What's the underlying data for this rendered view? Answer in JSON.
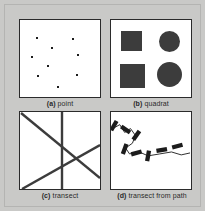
{
  "figure": {
    "background_color": "#c9c9c7",
    "panel_background_color": "#ffffff",
    "panel_border_color": "#2b2b2b",
    "ink_color": "#3c3c3c",
    "panels": [
      {
        "id": "a",
        "key": "(a)",
        "label": "point",
        "caption": "(a) point",
        "type": "point-sampling",
        "points": [
          {
            "x": 16,
            "y": 17
          },
          {
            "x": 52,
            "y": 18
          },
          {
            "x": 31,
            "y": 27
          },
          {
            "x": 11,
            "y": 36
          },
          {
            "x": 57,
            "y": 34
          },
          {
            "x": 27,
            "y": 45
          },
          {
            "x": 17,
            "y": 55
          },
          {
            "x": 56,
            "y": 54
          },
          {
            "x": 37,
            "y": 66
          }
        ]
      },
      {
        "id": "b",
        "key": "(b)",
        "label": "quadrat",
        "caption": "(b) quadrat",
        "type": "quadrat-sampling",
        "shapes": [
          {
            "kind": "square",
            "x": 10,
            "y": 11,
            "w": 21,
            "h": 20
          },
          {
            "kind": "circle",
            "x": 48,
            "y": 11,
            "w": 21,
            "h": 21
          },
          {
            "kind": "square",
            "x": 9,
            "y": 44,
            "w": 25,
            "h": 24
          },
          {
            "kind": "circle",
            "x": 46,
            "y": 42,
            "w": 25,
            "h": 25
          }
        ]
      },
      {
        "id": "c",
        "key": "(c)",
        "label": "transect",
        "caption": "(c) transect",
        "type": "transect-sampling",
        "lines": [
          {
            "name": "vertical-transect",
            "x1": 42,
            "y1": 0,
            "x2": 42,
            "y2": 78
          },
          {
            "name": "descending-diagonal",
            "x1": 1,
            "y1": 1,
            "x2": 80,
            "y2": 66
          },
          {
            "name": "ascending-diagonal",
            "x1": 2,
            "y1": 77,
            "x2": 80,
            "y2": 33
          }
        ]
      },
      {
        "id": "d",
        "key": "(d)",
        "label": "transect from path",
        "caption": "(d) transect from path",
        "type": "path-transect-sampling",
        "path": "M 0 17 L 9 12 L 14 20 L 20 16 L 25 23 L 22 31 L 15 36 L 19 42 L 29 40 L 38 44 L 50 42 L 62 40 L 72 43 L 81 41",
        "markers": [
          {
            "x": 3,
            "y": 13,
            "angle": 30
          },
          {
            "x": 15,
            "y": 17,
            "angle": -55
          },
          {
            "x": 26,
            "y": 23,
            "angle": 35
          },
          {
            "x": 14,
            "y": 37,
            "angle": 20
          },
          {
            "x": 26,
            "y": 41,
            "angle": 75
          },
          {
            "x": 38,
            "y": 44,
            "angle": 10
          },
          {
            "x": 52,
            "y": 38,
            "angle": 80
          },
          {
            "x": 68,
            "y": 34,
            "angle": 75
          }
        ]
      }
    ]
  }
}
